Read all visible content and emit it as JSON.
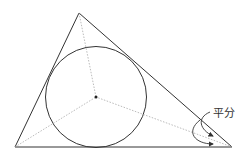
{
  "diagram": {
    "label": "平分",
    "vertices": {
      "top": [
        79,
        13
      ],
      "bottom_left": [
        15,
        147
      ],
      "bottom_right": [
        232,
        147
      ]
    },
    "incenter": [
      96,
      97
    ],
    "inradius": 50,
    "colors": {
      "stroke": "#333333",
      "bisector": "#bbbbbb",
      "background": "#ffffff"
    }
  }
}
